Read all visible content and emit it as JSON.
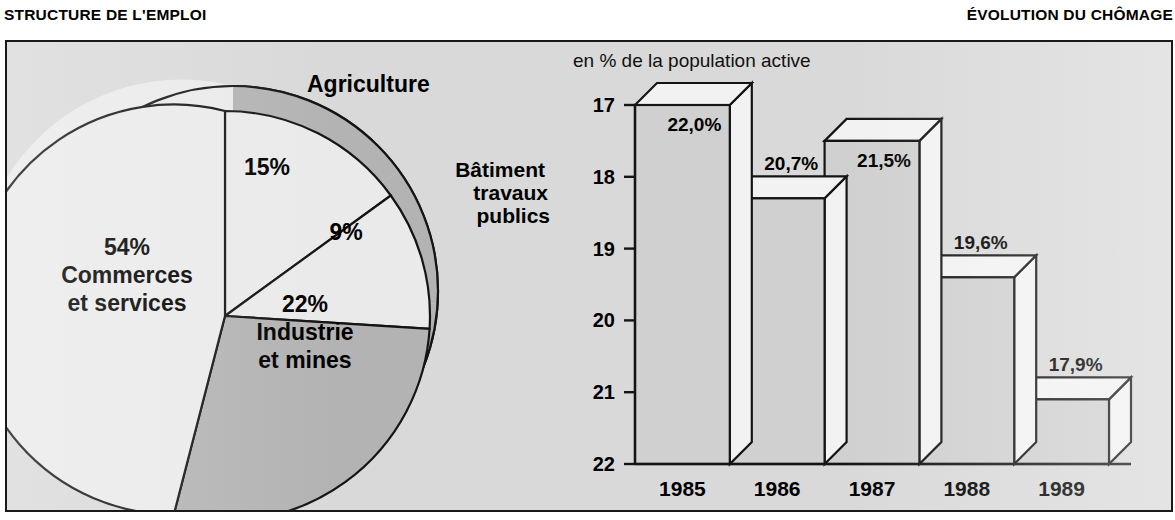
{
  "headers": {
    "left": "STRUCTURE DE L'EMPLOI",
    "right": "ÉVOLUTION DU CHÔMAGE"
  },
  "pie": {
    "labels": {
      "agriculture": "Agriculture",
      "batiment_l1": "Bâtiment",
      "batiment_l2": "travaux",
      "batiment_l3": "publics",
      "commerces_pct": "54%",
      "commerces_l1": "Commerces",
      "commerces_l2": "et services",
      "industrie_pct": "22%",
      "industrie_l1": "Industrie",
      "industrie_l2": "et mines",
      "agri_pct": "15%",
      "btp_pct": "9%"
    }
  },
  "bars": {
    "caption": "en % de la population active",
    "y_ticks": [
      "22",
      "21",
      "20",
      "19",
      "18",
      "17"
    ],
    "years": [
      "1985",
      "1986",
      "1987",
      "1988",
      "1989"
    ],
    "value_labels": [
      "22,0%",
      "20,7%",
      "21,5%",
      "19,6%",
      "17,9%"
    ]
  },
  "colors": {
    "panel_bg": "#d9d9d9",
    "slice_light": "#eaeaea",
    "slice_dark": "#b3b3b3",
    "bar_face": "#d0d0d0",
    "bar_top": "#f2f2f2",
    "outline": "#141414"
  },
  "chart_data": [
    {
      "type": "pie",
      "title": "STRUCTURE DE L'EMPLOI",
      "categories": [
        "Agriculture",
        "Bâtiment travaux publics",
        "Industrie et mines",
        "Commerces et services"
      ],
      "values": [
        15,
        9,
        22,
        54
      ],
      "value_labels": [
        "15%",
        "9%",
        "22%",
        "54%"
      ],
      "unit": "%",
      "legend": "inline-labels",
      "grid": false
    },
    {
      "type": "bar",
      "title": "ÉVOLUTION DU CHÔMAGE",
      "subtitle": "en % de la population active",
      "categories": [
        "1985",
        "1986",
        "1987",
        "1988",
        "1989"
      ],
      "values": [
        22.0,
        20.7,
        21.5,
        19.6,
        17.9
      ],
      "data_labels": [
        "22,0%",
        "20,7%",
        "21,5%",
        "19,6%",
        "17,9%"
      ],
      "xlabel": "",
      "ylabel": "en % de la population active",
      "ylim": [
        17,
        22
      ],
      "yticks": [
        17,
        18,
        19,
        20,
        21,
        22
      ],
      "grid": false,
      "legend": "none"
    }
  ]
}
